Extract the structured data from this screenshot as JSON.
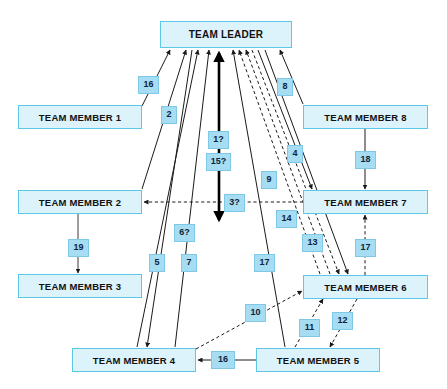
{
  "diagram": {
    "colors": {
      "node_fill": "#ddf3fb",
      "node_border": "#5cc8e8",
      "label_fill": "#a6ddf3",
      "label_border": "#7ec9e8",
      "edge_solid": "#1a1a1a",
      "edge_dashed": "#1a1a1a",
      "background": "#ffffff"
    },
    "nodes": [
      {
        "id": "leader",
        "label": "TEAM LEADER",
        "x": 160,
        "y": 21,
        "w": 132,
        "h": 27
      },
      {
        "id": "member1",
        "label": "TEAM MEMBER 1",
        "x": 18,
        "y": 105,
        "w": 124,
        "h": 24
      },
      {
        "id": "member8",
        "label": "TEAM MEMBER 8",
        "x": 303,
        "y": 105,
        "w": 125,
        "h": 24
      },
      {
        "id": "member2",
        "label": "TEAM MEMBER 2",
        "x": 18,
        "y": 190,
        "w": 124,
        "h": 24
      },
      {
        "id": "member7",
        "label": "TEAM MEMBER 7",
        "x": 303,
        "y": 190,
        "w": 125,
        "h": 24
      },
      {
        "id": "member3",
        "label": "TEAM MEMBER 3",
        "x": 18,
        "y": 274,
        "w": 124,
        "h": 24
      },
      {
        "id": "member6",
        "label": "TEAM MEMBER 6",
        "x": 303,
        "y": 275,
        "w": 125,
        "h": 24
      },
      {
        "id": "member4",
        "label": "TEAM MEMBER 4",
        "x": 72,
        "y": 348,
        "w": 124,
        "h": 24
      },
      {
        "id": "member5",
        "label": "TEAM MEMBER 5",
        "x": 256,
        "y": 348,
        "w": 124,
        "h": 24
      }
    ],
    "edge_labels": [
      {
        "id": "lbl-16a",
        "text": "16",
        "x": 138,
        "y": 76,
        "w": 21,
        "h": 18
      },
      {
        "id": "lbl-2",
        "text": "2",
        "x": 161,
        "y": 106,
        "w": 16,
        "h": 18
      },
      {
        "id": "lbl-8",
        "text": "8",
        "x": 277,
        "y": 78,
        "w": 16,
        "h": 18
      },
      {
        "id": "lbl-1q",
        "text": "1?",
        "x": 208,
        "y": 131,
        "w": 21,
        "h": 18
      },
      {
        "id": "lbl-15q",
        "text": "15?",
        "x": 206,
        "y": 153,
        "w": 25,
        "h": 18
      },
      {
        "id": "lbl-4",
        "text": "4",
        "x": 287,
        "y": 145,
        "w": 16,
        "h": 18
      },
      {
        "id": "lbl-18",
        "text": "18",
        "x": 355,
        "y": 151,
        "w": 21,
        "h": 18
      },
      {
        "id": "lbl-9",
        "text": "9",
        "x": 261,
        "y": 171,
        "w": 16,
        "h": 18
      },
      {
        "id": "lbl-3q",
        "text": "3?",
        "x": 224,
        "y": 194,
        "w": 21,
        "h": 18
      },
      {
        "id": "lbl-14",
        "text": "14",
        "x": 276,
        "y": 210,
        "w": 21,
        "h": 18
      },
      {
        "id": "lbl-6q",
        "text": "6?",
        "x": 174,
        "y": 224,
        "w": 21,
        "h": 18
      },
      {
        "id": "lbl-13",
        "text": "13",
        "x": 302,
        "y": 234,
        "w": 21,
        "h": 18
      },
      {
        "id": "lbl-19",
        "text": "19",
        "x": 68,
        "y": 239,
        "w": 21,
        "h": 18
      },
      {
        "id": "lbl-17b",
        "text": "17",
        "x": 355,
        "y": 239,
        "w": 21,
        "h": 18
      },
      {
        "id": "lbl-5",
        "text": "5",
        "x": 149,
        "y": 254,
        "w": 16,
        "h": 18
      },
      {
        "id": "lbl-7",
        "text": "7",
        "x": 181,
        "y": 254,
        "w": 16,
        "h": 18
      },
      {
        "id": "lbl-17a",
        "text": "17",
        "x": 254,
        "y": 254,
        "w": 21,
        "h": 18
      },
      {
        "id": "lbl-10",
        "text": "10",
        "x": 245,
        "y": 304,
        "w": 21,
        "h": 18
      },
      {
        "id": "lbl-12",
        "text": "12",
        "x": 332,
        "y": 312,
        "w": 21,
        "h": 18
      },
      {
        "id": "lbl-11",
        "text": "11",
        "x": 299,
        "y": 319,
        "w": 21,
        "h": 18
      },
      {
        "id": "lbl-16b",
        "text": "16",
        "x": 211,
        "y": 351,
        "w": 24,
        "h": 18
      }
    ],
    "edges": [
      {
        "id": "e16a",
        "label": "16",
        "from": "member1",
        "to": "leader",
        "style": "solid",
        "direction": "to-leader"
      },
      {
        "id": "e2",
        "label": "2",
        "from": "member2",
        "to": "leader",
        "style": "solid",
        "direction": "to-leader"
      },
      {
        "id": "e5",
        "label": "5",
        "from": "leader",
        "to": "member4",
        "style": "solid",
        "direction": "to-member"
      },
      {
        "id": "e6q",
        "label": "6?",
        "from": "member4",
        "to": "leader",
        "style": "solid",
        "direction": "to-leader"
      },
      {
        "id": "e7",
        "label": "7",
        "from": "member4",
        "to": "leader",
        "style": "solid",
        "direction": "to-leader"
      },
      {
        "id": "e1q",
        "label": "1?",
        "from": "leader",
        "to": "member2",
        "style": "solid-thick",
        "direction": "bidirectional"
      },
      {
        "id": "e15q",
        "label": "15?",
        "from": "leader",
        "to": "member2",
        "style": "solid-thick",
        "direction": "bidirectional"
      },
      {
        "id": "e17a",
        "label": "17",
        "from": "member5",
        "to": "leader",
        "style": "solid",
        "direction": "to-leader"
      },
      {
        "id": "e9",
        "label": "9",
        "from": "member6",
        "to": "leader",
        "style": "dashed",
        "direction": "to-leader"
      },
      {
        "id": "e14",
        "label": "14",
        "from": "member6",
        "to": "leader",
        "style": "dashed",
        "direction": "to-leader"
      },
      {
        "id": "e13",
        "label": "13",
        "from": "leader",
        "to": "member6",
        "style": "dashed",
        "direction": "to-member"
      },
      {
        "id": "e4",
        "label": "4",
        "from": "leader",
        "to": "member7",
        "style": "solid",
        "direction": "to-member"
      },
      {
        "id": "e8",
        "label": "8",
        "from": "member8",
        "to": "leader",
        "style": "solid",
        "direction": "to-leader"
      },
      {
        "id": "e18",
        "label": "18",
        "from": "member8",
        "to": "member7",
        "style": "solid",
        "direction": "to-member"
      },
      {
        "id": "e3q",
        "label": "3?",
        "from": "member7",
        "to": "member2",
        "style": "dashed",
        "direction": "to-member"
      },
      {
        "id": "e19",
        "label": "19",
        "from": "member2",
        "to": "member3",
        "style": "solid",
        "direction": "to-member"
      },
      {
        "id": "e17b",
        "label": "17",
        "from": "member6",
        "to": "member7",
        "style": "dashed",
        "direction": "to-member"
      },
      {
        "id": "e10",
        "label": "10",
        "from": "member4",
        "to": "member6",
        "style": "dashed",
        "direction": "to-member"
      },
      {
        "id": "e11",
        "label": "11",
        "from": "member5",
        "to": "member6",
        "style": "dashed",
        "direction": "to-member"
      },
      {
        "id": "e12",
        "label": "12",
        "from": "member6",
        "to": "member5",
        "style": "dashed",
        "direction": "to-member"
      },
      {
        "id": "e16b",
        "label": "16",
        "from": "member5",
        "to": "member4",
        "style": "solid",
        "direction": "to-member"
      }
    ]
  }
}
